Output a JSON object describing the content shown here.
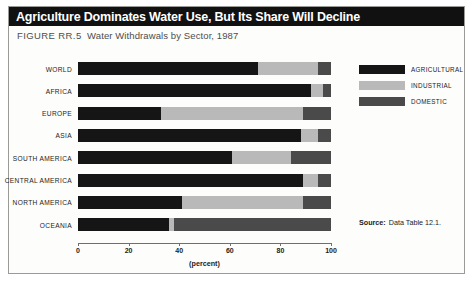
{
  "figure": {
    "title": "Agriculture Dominates Water Use, But Its Share Will Decline",
    "figure_id": "FIGURE  RR.5",
    "subtitle": "Water Withdrawals by Sector, 1987",
    "source_label": "Source:",
    "source_value": "Data Table 12.1."
  },
  "colors": {
    "agricultural": "#151515",
    "industrial": "#b9b9b9",
    "domestic": "#4a4a4a",
    "title_bar": "#111111",
    "title_text": "#ffffff",
    "frame_border": "#9a9a96",
    "axis": "#6f6f6f"
  },
  "chart_data": {
    "type": "bar",
    "orientation": "horizontal",
    "stacked": true,
    "title": "Agriculture Dominates Water Use, But Its Share Will Decline",
    "subtitle": "Water Withdrawals by Sector, 1987",
    "xlabel": "(percent)",
    "ylabel": "",
    "xlim": [
      0,
      100
    ],
    "xticks": [
      0,
      20,
      40,
      60,
      80,
      100
    ],
    "xticklabels": [
      "0",
      "20",
      "40",
      "60",
      "80",
      "100"
    ],
    "grid": false,
    "legend_position": "right",
    "categories": [
      "WORLD",
      "AFRICA",
      "EUROPE",
      "ASIA",
      "SOUTH AMERICA",
      "CENTRAL AMERICA",
      "NORTH AMERICA",
      "OCEANIA"
    ],
    "series": [
      {
        "name": "AGRICULTURAL",
        "color": "#151515",
        "values": [
          71,
          92,
          33,
          88,
          61,
          89,
          41,
          36
        ]
      },
      {
        "name": "INDUSTRIAL",
        "color": "#b9b9b9",
        "values": [
          24,
          5,
          56,
          7,
          23,
          6,
          48,
          2
        ]
      },
      {
        "name": "DOMESTIC",
        "color": "#4a4a4a",
        "values": [
          5,
          3,
          11,
          5,
          16,
          5,
          11,
          62
        ]
      }
    ]
  }
}
